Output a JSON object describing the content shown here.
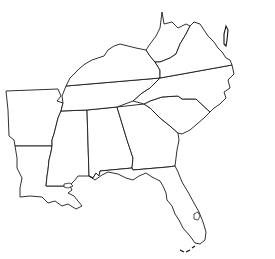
{
  "map": {
    "type": "blank outline map",
    "region": "Southeastern United States",
    "labels_visible": false,
    "background_color": "#ffffff",
    "stroke_color": "#1a1a1a",
    "states": [
      {
        "id": "arkansas",
        "name": "Arkansas"
      },
      {
        "id": "louisiana",
        "name": "Louisiana"
      },
      {
        "id": "mississippi",
        "name": "Mississippi"
      },
      {
        "id": "alabama",
        "name": "Alabama"
      },
      {
        "id": "georgia",
        "name": "Georgia"
      },
      {
        "id": "florida",
        "name": "Florida"
      },
      {
        "id": "south-carolina",
        "name": "South Carolina"
      },
      {
        "id": "north-carolina",
        "name": "North Carolina"
      },
      {
        "id": "tennessee",
        "name": "Tennessee"
      },
      {
        "id": "kentucky",
        "name": "Kentucky"
      },
      {
        "id": "west-virginia",
        "name": "West Virginia"
      },
      {
        "id": "virginia",
        "name": "Virginia"
      }
    ]
  }
}
